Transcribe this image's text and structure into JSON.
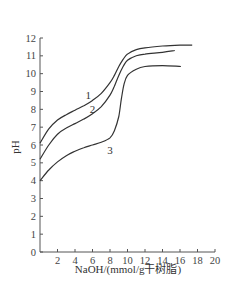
{
  "chart_data": {
    "type": "line",
    "title": "",
    "xlabel": "NaOH/(mmol/g干树脂)",
    "ylabel": "pH",
    "xlim": [
      0,
      20
    ],
    "ylim": [
      0,
      12
    ],
    "xticks": [
      2,
      4,
      6,
      8,
      10,
      12,
      14,
      16,
      18,
      20
    ],
    "yticks": [
      0,
      1,
      2,
      3,
      4,
      5,
      6,
      7,
      8,
      9,
      10,
      11,
      12
    ],
    "grid": false,
    "legend": "inline curve labels",
    "series": [
      {
        "name": "1",
        "x": [
          0,
          1,
          2,
          3,
          4,
          5,
          6,
          7,
          8,
          8.5,
          9,
          9.5,
          10,
          11,
          12,
          14,
          16,
          17.4
        ],
        "y": [
          6.1,
          6.9,
          7.4,
          7.7,
          7.95,
          8.2,
          8.5,
          8.9,
          9.5,
          9.9,
          10.4,
          10.8,
          11.1,
          11.35,
          11.45,
          11.55,
          11.6,
          11.6
        ]
      },
      {
        "name": "2",
        "x": [
          0,
          1,
          2,
          3,
          4,
          5,
          6,
          7,
          8,
          8.5,
          9,
          9.5,
          10,
          11,
          12,
          14,
          15.4
        ],
        "y": [
          5.2,
          6.0,
          6.6,
          6.95,
          7.2,
          7.45,
          7.75,
          8.15,
          8.8,
          9.3,
          9.9,
          10.4,
          10.75,
          11.0,
          11.1,
          11.2,
          11.3
        ]
      },
      {
        "name": "3",
        "x": [
          0,
          1,
          2,
          3,
          4,
          5,
          6,
          7,
          8,
          8.5,
          9,
          9.3,
          9.6,
          10,
          11,
          12,
          14,
          16.1
        ],
        "y": [
          4.0,
          4.6,
          5.05,
          5.4,
          5.65,
          5.85,
          6.0,
          6.15,
          6.4,
          6.8,
          7.6,
          8.6,
          9.4,
          9.9,
          10.25,
          10.4,
          10.45,
          10.4
        ]
      }
    ],
    "curve_labels": [
      {
        "text": "1",
        "x": 5.5,
        "y": 8.6
      },
      {
        "text": "2",
        "x": 6.0,
        "y": 7.8
      },
      {
        "text": "3",
        "x": 8.0,
        "y": 5.5
      }
    ]
  }
}
